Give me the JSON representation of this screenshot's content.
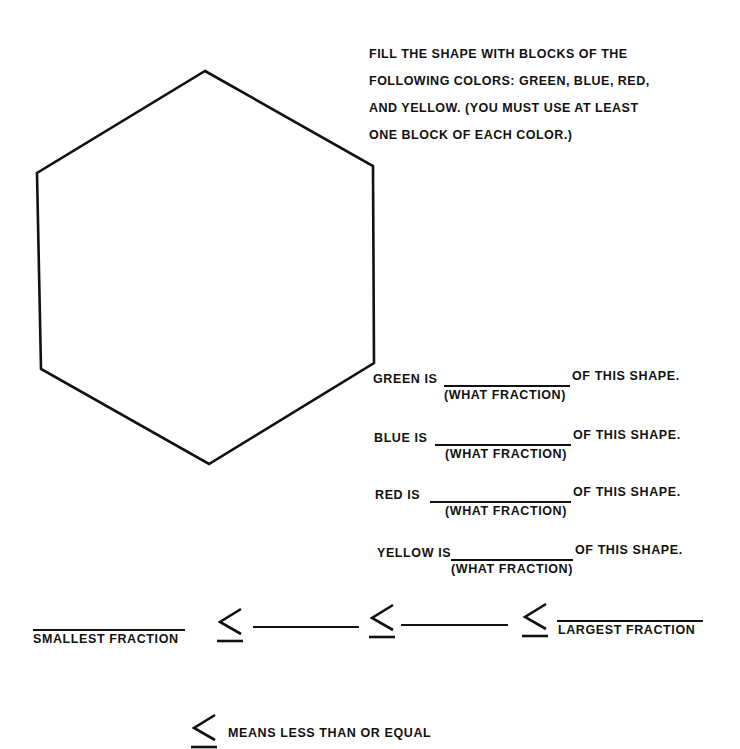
{
  "instructions": {
    "lines": [
      "FILL THE SHAPE WITH BLOCKS OF THE",
      "FOLLOWING COLORS: GREEN, BLUE, RED,",
      "AND YELLOW. (YOU MUST USE AT LEAST",
      "ONE BLOCK OF EACH COLOR.)"
    ]
  },
  "shape": {
    "name": "hexagon",
    "vertices": [
      [
        205,
        71
      ],
      [
        373,
        166
      ],
      [
        374,
        363
      ],
      [
        209,
        464
      ],
      [
        41,
        369
      ],
      [
        37,
        173
      ]
    ],
    "stroke": "#111111"
  },
  "fraction_questions": [
    {
      "color": "GREEN",
      "label": "GREEN IS",
      "suffix": "OF THIS SHAPE.",
      "hint": "(WHAT FRACTION)",
      "answer": ""
    },
    {
      "color": "BLUE",
      "label": "BLUE IS",
      "suffix": "OF THIS SHAPE.",
      "hint": "(WHAT FRACTION)",
      "answer": ""
    },
    {
      "color": "RED",
      "label": "RED IS",
      "suffix": "OF THIS SHAPE.",
      "hint": "(WHAT FRACTION)",
      "answer": ""
    },
    {
      "color": "YELLOW",
      "label": "YELLOW IS",
      "suffix": "OF THIS SHAPE.",
      "hint": "(WHAT FRACTION)",
      "answer": ""
    }
  ],
  "ordering": {
    "smallest_label": "SMALLEST FRACTION",
    "largest_label": "LARGEST FRACTION",
    "symbol": "≤",
    "blanks": [
      "",
      "",
      "",
      ""
    ]
  },
  "legend": {
    "symbol": "≤",
    "text": "MEANS LESS THAN OR EQUAL"
  }
}
